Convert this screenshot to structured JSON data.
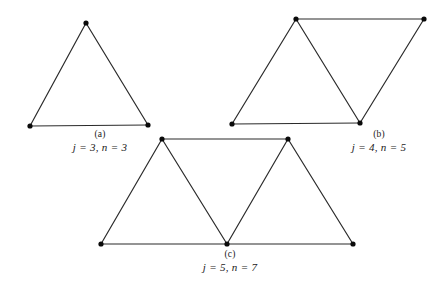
{
  "figure": {
    "background_color": "#ffffff",
    "stroke_color": "#2b2b2b",
    "vertex_color": "#0a0a0a",
    "stroke_width": 1.2,
    "vertex_radius": 2.6,
    "panels": [
      {
        "id": "a",
        "letter": "(a)",
        "formula": "j = 3, n = 3",
        "j": 3,
        "n": 3,
        "vertex_count": 3,
        "edge_count": 3,
        "vertices": [
          {
            "name": "apex",
            "x": 86,
            "y": 23
          },
          {
            "name": "bottom-left",
            "x": 30,
            "y": 126
          },
          {
            "name": "bottom-right",
            "x": 148,
            "y": 125
          }
        ],
        "edges": [
          [
            0,
            1
          ],
          [
            1,
            2
          ],
          [
            2,
            0
          ]
        ]
      },
      {
        "id": "b",
        "letter": "(b)",
        "formula": "j = 4, n = 5",
        "j": 4,
        "n": 5,
        "vertex_count": 4,
        "edge_count": 5,
        "vertices": [
          {
            "name": "top-left",
            "x": 296,
            "y": 19
          },
          {
            "name": "top-right",
            "x": 424,
            "y": 19
          },
          {
            "name": "bottom-left",
            "x": 232,
            "y": 124
          },
          {
            "name": "bottom-mid",
            "x": 360,
            "y": 123
          }
        ],
        "edges": [
          [
            0,
            1
          ],
          [
            0,
            2
          ],
          [
            0,
            3
          ],
          [
            2,
            3
          ],
          [
            1,
            3
          ]
        ]
      },
      {
        "id": "c",
        "letter": "(c)",
        "formula": "j = 5, n = 7",
        "j": 5,
        "n": 7,
        "vertex_count": 5,
        "edge_count": 7,
        "vertices": [
          {
            "name": "top-left",
            "x": 162,
            "y": 139
          },
          {
            "name": "top-right",
            "x": 288,
            "y": 139
          },
          {
            "name": "bottom-left",
            "x": 101,
            "y": 244
          },
          {
            "name": "bottom-mid",
            "x": 227,
            "y": 244
          },
          {
            "name": "bottom-right",
            "x": 353,
            "y": 244
          }
        ],
        "edges": [
          [
            0,
            1
          ],
          [
            0,
            2
          ],
          [
            0,
            3
          ],
          [
            1,
            3
          ],
          [
            1,
            4
          ],
          [
            2,
            3
          ],
          [
            3,
            4
          ]
        ]
      }
    ]
  }
}
